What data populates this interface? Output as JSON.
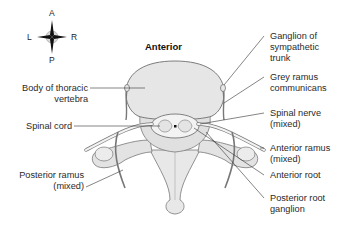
{
  "diagram": {
    "title": "Anterior",
    "compass": {
      "anterior": "A",
      "posterior": "P",
      "left": "L",
      "right": "R"
    },
    "labels_left": [
      {
        "line1": "Body of thoracic",
        "line2": "vertebra"
      },
      {
        "line1": "Spinal cord",
        "line2": ""
      },
      {
        "line1": "Posterior ramus",
        "line2": "(mixed)"
      }
    ],
    "labels_right": [
      {
        "line1": "Ganglion of",
        "line2": "sympathetic",
        "line3": "trunk"
      },
      {
        "line1": "Grey ramus",
        "line2": "communicans"
      },
      {
        "line1": "Spinal nerve",
        "line2": "(mixed)"
      },
      {
        "line1": "Anterior ramus",
        "line2": "(mixed)"
      },
      {
        "line1": "Anterior root",
        "line2": ""
      },
      {
        "line1": "Posterior root",
        "line2": "ganglion"
      }
    ],
    "colors": {
      "bone_fill": "#e6e6e6",
      "bone_stroke": "#6e6e6e",
      "nerve_fill": "#f2f2f2",
      "leader_line": "#333333"
    }
  }
}
